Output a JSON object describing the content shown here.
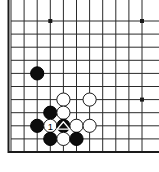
{
  "figure": {
    "kind": "go-board-diagram",
    "title": ""
  },
  "board": {
    "corner": "bottom-left",
    "visible_columns": 11,
    "visible_rows": 11,
    "grid_spacing_px": 13.1,
    "origin_x_px": 11,
    "origin_y_px": 21,
    "line_color": "#2a2a2a",
    "edge_color": "#1a1a1a",
    "line_width_px": 1,
    "edge_width_px": 2,
    "background_color": "#ffffff",
    "border_bottom": true,
    "border_left": true,
    "star_points": [
      {
        "col": 3,
        "row": 0
      },
      {
        "col": 10,
        "row": 0
      },
      {
        "col": 10,
        "row": 6
      }
    ]
  },
  "stones": [
    {
      "id": "b1",
      "color": "black",
      "col": 2,
      "row": 4,
      "label": "",
      "mark": ""
    },
    {
      "id": "w1",
      "color": "white",
      "col": 4,
      "row": 6,
      "label": "",
      "mark": ""
    },
    {
      "id": "w2",
      "color": "white",
      "col": 6,
      "row": 6,
      "label": "",
      "mark": ""
    },
    {
      "id": "b2",
      "color": "black",
      "col": 3,
      "row": 7,
      "label": "",
      "mark": ""
    },
    {
      "id": "w3",
      "color": "white",
      "col": 4,
      "row": 7,
      "label": "",
      "mark": ""
    },
    {
      "id": "b3",
      "color": "black",
      "col": 2,
      "row": 8,
      "label": "",
      "mark": ""
    },
    {
      "id": "w4",
      "color": "white",
      "col": 3,
      "row": 8,
      "label": "1",
      "mark": "number"
    },
    {
      "id": "b4",
      "color": "black",
      "col": 4,
      "row": 8,
      "label": "",
      "mark": "triangle"
    },
    {
      "id": "w5",
      "color": "white",
      "col": 5,
      "row": 8,
      "label": "",
      "mark": ""
    },
    {
      "id": "w6",
      "color": "white",
      "col": 6,
      "row": 8,
      "label": "",
      "mark": ""
    },
    {
      "id": "b5",
      "color": "black",
      "col": 3,
      "row": 9,
      "label": "",
      "mark": ""
    },
    {
      "id": "w7",
      "color": "white",
      "col": 4,
      "row": 9,
      "label": "",
      "mark": ""
    },
    {
      "id": "b6",
      "color": "black",
      "col": 5,
      "row": 9,
      "label": "",
      "mark": ""
    }
  ],
  "colors": {
    "black_stone_fill": "#0d0d0d",
    "black_stone_stroke": "#000000",
    "white_stone_fill": "#ffffff",
    "white_stone_stroke": "#1a1a1a",
    "label_on_white": "#000000",
    "label_on_black": "#ffffff",
    "triangle_fill": "#ffffff",
    "triangle_stroke": "#ffffff"
  },
  "stone_radius_px": 6.6
}
